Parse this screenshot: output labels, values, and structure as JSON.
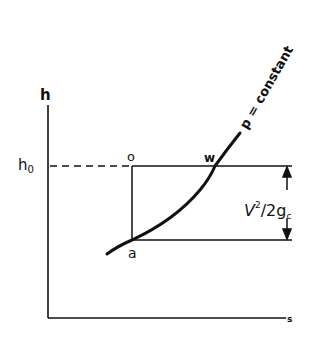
{
  "diagram": {
    "type": "h-s diagram (enthalpy-entropy)",
    "axes": {
      "y_label": "h",
      "x_label": "s"
    },
    "reference_line": {
      "label": "h",
      "label_subscript": "0"
    },
    "points": {
      "o": "o",
      "w": "w",
      "a": "a"
    },
    "curve_label": "p = constant",
    "velocity_term": {
      "numerator": "V",
      "superscript": "2",
      "denominator": "2g",
      "denominator_subscript": "c"
    },
    "colors": {
      "ink": "#111111",
      "background": "#ffffff"
    }
  }
}
